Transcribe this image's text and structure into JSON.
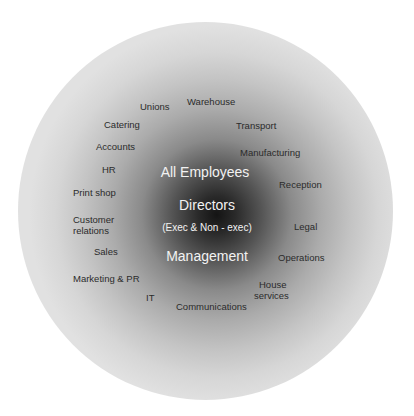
{
  "diagram": {
    "type": "stakeholder-sphere",
    "colors": {
      "background": "#ffffff",
      "center": "#141414",
      "edge": "#e1e1e1",
      "outer_label_text": "#2b2b2b",
      "core_label_text": "#f2f2f2"
    },
    "core": {
      "all_employees": "All Employees",
      "directors": "Directors",
      "directors_note": "(Exec & Non - exec)",
      "management": "Management"
    },
    "departments": [
      {
        "label": "Unions"
      },
      {
        "label": "Warehouse"
      },
      {
        "label": "Catering"
      },
      {
        "label": "Transport"
      },
      {
        "label": "Accounts"
      },
      {
        "label": "Manufacturing"
      },
      {
        "label": "HR"
      },
      {
        "label": "Print shop"
      },
      {
        "label": "Reception"
      },
      {
        "label": "Customer"
      },
      {
        "label": "relations"
      },
      {
        "label": "Legal"
      },
      {
        "label": "Sales"
      },
      {
        "label": "Operations"
      },
      {
        "label": "Marketing & PR"
      },
      {
        "label": "House"
      },
      {
        "label": "services"
      },
      {
        "label": "IT"
      },
      {
        "label": "Communications"
      }
    ]
  }
}
